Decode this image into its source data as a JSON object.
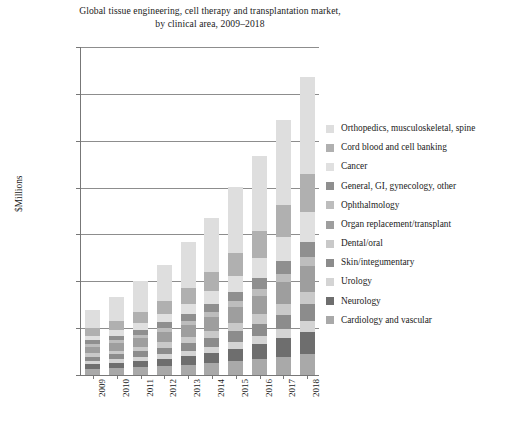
{
  "chart_data": {
    "type": "bar",
    "stacked": true,
    "title": "Global tissue engineering, cell therapy and transplantation market, by clinical area, 2009–2018",
    "title_line1": "Global tissue engineering, cell therapy and transplantation market,",
    "title_line2": "by clinical area, 2009–2018",
    "xlabel": "",
    "ylabel": "$Millions",
    "ylim": [
      0,
      35000
    ],
    "ytick_step": 5000,
    "grid": true,
    "legend_position": "right",
    "categories": [
      "2009",
      "2010",
      "2011",
      "2012",
      "2013",
      "2014",
      "2015",
      "2016",
      "2017",
      "2018"
    ],
    "ytick_labels": [
      "$0",
      "$5,000",
      "$10,000",
      "$15,000",
      "$20,000",
      "$25,000",
      "$30,000",
      "$35,000"
    ],
    "ytick_values": [
      0,
      5000,
      10000,
      15000,
      20000,
      25000,
      30000,
      35000
    ],
    "totals": [
      7000,
      8300,
      10000,
      11800,
      14200,
      16800,
      20100,
      23400,
      27200,
      31800
    ],
    "series": [
      {
        "name": "Cardiology and vascular",
        "color": "#a9a9a9",
        "values": [
          650,
          720,
          820,
          940,
          1080,
          1250,
          1450,
          1680,
          1950,
          2250
        ]
      },
      {
        "name": "Neurology",
        "color": "#6e6e6e",
        "values": [
          520,
          600,
          700,
          820,
          970,
          1150,
          1380,
          1650,
          1980,
          2380
        ]
      },
      {
        "name": "Urology",
        "color": "#d4d4d4",
        "values": [
          300,
          340,
          390,
          450,
          520,
          600,
          700,
          810,
          940,
          1090
        ]
      },
      {
        "name": "Skin/integumentary",
        "color": "#8c8c8c",
        "values": [
          480,
          545,
          630,
          730,
          850,
          990,
          1160,
          1350,
          1570,
          1830
        ]
      },
      {
        "name": "Dental/oral",
        "color": "#c9c9c9",
        "values": [
          360,
          410,
          470,
          545,
          630,
          735,
          860,
          1000,
          1165,
          1355
        ]
      },
      {
        "name": "Organ replacement/transplant",
        "color": "#9e9e9e",
        "values": [
          700,
          800,
          930,
          1080,
          1250,
          1450,
          1700,
          1980,
          2300,
          2680
        ]
      },
      {
        "name": "Ophthalmology",
        "color": "#bdbdbd",
        "values": [
          270,
          310,
          355,
          410,
          475,
          550,
          645,
          750,
          870,
          1015
        ]
      },
      {
        "name": "General, GI, gynecology, other",
        "color": "#8f8f8f",
        "values": [
          420,
          480,
          555,
          645,
          745,
          865,
          1010,
          1175,
          1370,
          1595
        ]
      },
      {
        "name": "Cancer",
        "color": "#e0e0e0",
        "values": [
          500,
          600,
          740,
          900,
          1120,
          1380,
          1720,
          2100,
          2580,
          3160
        ]
      },
      {
        "name": "Cord blood and cell banking",
        "color": "#b0b0b0",
        "values": [
          800,
          950,
          1150,
          1380,
          1680,
          2020,
          2450,
          2920,
          3470,
          4120
        ]
      },
      {
        "name": "Orthopedics, musculoskeletal, spine",
        "color": "#dedede",
        "values": [
          2000,
          2545,
          3260,
          3900,
          4880,
          5810,
          7025,
          7985,
          9005,
          10325
        ]
      }
    ],
    "legend_order": [
      "Orthopedics, musculoskeletal, spine",
      "Cord blood and cell banking",
      "Cancer",
      "General, GI, gynecology, other",
      "Ophthalmology",
      "Organ replacement/transplant",
      "Dental/oral",
      "Skin/integumentary",
      "Urology",
      "Neurology",
      "Cardiology and vascular"
    ],
    "legend": [
      {
        "label": "Orthopedics, musculoskeletal, spine",
        "color": "#dedede"
      },
      {
        "label": "Cord blood and cell banking",
        "color": "#b0b0b0"
      },
      {
        "label": "Cancer",
        "color": "#e0e0e0"
      },
      {
        "label": "General, GI, gynecology, other",
        "color": "#8f8f8f"
      },
      {
        "label": "Ophthalmology",
        "color": "#bdbdbd"
      },
      {
        "label": "Organ replacement/transplant",
        "color": "#9e9e9e"
      },
      {
        "label": "Dental/oral",
        "color": "#c9c9c9"
      },
      {
        "label": "Skin/integumentary",
        "color": "#8c8c8c"
      },
      {
        "label": "Urology",
        "color": "#d4d4d4"
      },
      {
        "label": "Neurology",
        "color": "#6e6e6e"
      },
      {
        "label": "Cardiology and vascular",
        "color": "#a9a9a9"
      }
    ]
  }
}
